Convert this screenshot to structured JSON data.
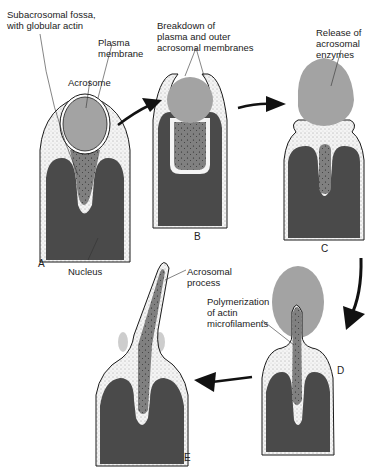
{
  "figure": {
    "colors": {
      "background": "#ffffff",
      "acrosome": "#a3a3a3",
      "nucleus": "#4a4a4a",
      "cytoplasm_stipple": "#f2f2f2",
      "subacrosomal_fossa": "#7c7c7c",
      "outline": "#1a1a1a",
      "arrow": "#111111"
    },
    "stages": [
      {
        "id": "A",
        "label": "A"
      },
      {
        "id": "B",
        "label": "B"
      },
      {
        "id": "C",
        "label": "C"
      },
      {
        "id": "D",
        "label": "D"
      },
      {
        "id": "E",
        "label": "E"
      }
    ],
    "labels": {
      "subacrosomal_fossa": "Subacrosomal fossa,\nwith globular actin",
      "plasma_membrane": "Plasma\nmembrane",
      "acrosome": "Acrosome",
      "breakdown": "Breakdown of\nplasma and outer\nacrosomal membranes",
      "release": "Release of\nacrosomal\nenzymes",
      "nucleus": "Nucleus",
      "acrosomal_process": "Acrosomal\nprocess",
      "polymerization": "Polymerization\nof actin\nmicrofilaments"
    },
    "arrows": [
      {
        "from": "A",
        "to": "B",
        "icon": "arrow-right-up-icon"
      },
      {
        "from": "B",
        "to": "C",
        "icon": "arrow-right-icon"
      },
      {
        "from": "C",
        "to": "D",
        "icon": "arrow-curved-down-icon"
      },
      {
        "from": "D",
        "to": "E",
        "icon": "arrow-left-icon"
      }
    ]
  }
}
